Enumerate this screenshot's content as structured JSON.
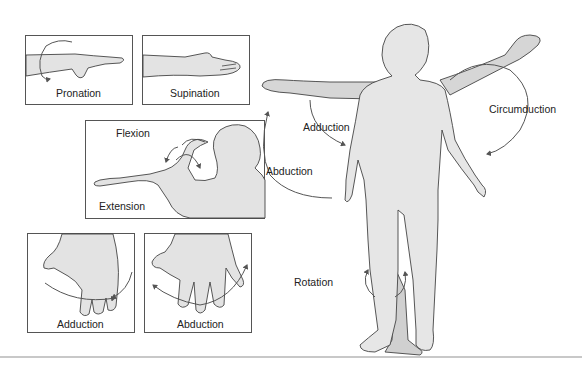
{
  "figure": {
    "colors": {
      "skin_fill": "#e6e6e6",
      "skin_shadow": "#cfcfcf",
      "outline": "#444444",
      "arrow": "#555555",
      "panel_border": "#555555"
    },
    "panels": [
      {
        "id": "pronation",
        "label": "Pronation"
      },
      {
        "id": "supination",
        "label": "Supination"
      },
      {
        "id": "flexion-extension",
        "labels": [
          "Flexion",
          "Extension"
        ]
      },
      {
        "id": "finger-adduction",
        "label": "Adduction"
      },
      {
        "id": "finger-abduction",
        "label": "Abduction"
      }
    ],
    "body_labels": {
      "adduction": "Adduction",
      "abduction": "Abduction",
      "circumduction": "Circumduction",
      "rotation": "Rotation"
    }
  }
}
